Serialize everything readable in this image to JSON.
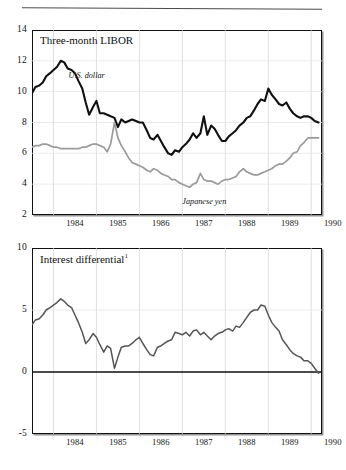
{
  "figure": {
    "has_top_rule": true
  },
  "chart_data": [
    {
      "type": "line",
      "title": "Three-month LIBOR",
      "xlabel": "",
      "ylabel": "",
      "grid": true,
      "legend_position": "inline-annotation",
      "xlim": [
        1983.5,
        1990.25
      ],
      "ylim": [
        2,
        14
      ],
      "yticks": [
        2,
        4,
        6,
        8,
        10,
        12,
        14
      ],
      "xticks": [
        1984,
        1985,
        1986,
        1987,
        1988,
        1989,
        1990
      ],
      "xtick_labels": [
        "1984",
        "1985",
        "1986",
        "1987",
        "1988",
        "1989",
        "1990"
      ],
      "ytick_labels": [
        "2",
        "4",
        "6",
        "8",
        "10",
        "12",
        "14"
      ],
      "annotations": [
        {
          "text": "U.S. dollar",
          "x": 1984.35,
          "y": 11.0,
          "style": "italic"
        },
        {
          "text": "Japanese yen",
          "x": 1987.0,
          "y": 2.85,
          "style": "italic"
        }
      ],
      "x": [
        1983.5,
        1983.58,
        1983.67,
        1983.75,
        1983.83,
        1983.92,
        1984.0,
        1984.08,
        1984.17,
        1984.25,
        1984.33,
        1984.42,
        1984.5,
        1984.58,
        1984.67,
        1984.75,
        1984.83,
        1984.92,
        1985.0,
        1985.08,
        1985.17,
        1985.25,
        1985.33,
        1985.42,
        1985.5,
        1985.58,
        1985.67,
        1985.75,
        1985.83,
        1985.92,
        1986.0,
        1986.08,
        1986.17,
        1986.25,
        1986.33,
        1986.42,
        1986.5,
        1986.58,
        1986.67,
        1986.75,
        1986.83,
        1986.92,
        1987.0,
        1987.08,
        1987.17,
        1987.25,
        1987.33,
        1987.42,
        1987.5,
        1987.58,
        1987.67,
        1987.75,
        1987.83,
        1987.92,
        1988.0,
        1988.08,
        1988.17,
        1988.25,
        1988.33,
        1988.42,
        1988.5,
        1988.58,
        1988.67,
        1988.75,
        1988.83,
        1988.92,
        1989.0,
        1989.08,
        1989.17,
        1989.25,
        1989.33,
        1989.42,
        1989.5,
        1989.58,
        1989.67,
        1989.75,
        1989.83,
        1989.92,
        1990.0,
        1990.08,
        1990.17
      ],
      "series": [
        {
          "name": "U.S. dollar",
          "color": "#111111",
          "width": 2.1,
          "values": [
            9.9,
            10.3,
            10.4,
            10.6,
            11.0,
            11.2,
            11.4,
            11.6,
            12.0,
            11.9,
            11.5,
            11.4,
            11.2,
            10.7,
            10.2,
            9.3,
            8.5,
            9.0,
            9.4,
            8.6,
            8.6,
            8.5,
            8.4,
            8.3,
            7.7,
            8.2,
            8.0,
            8.1,
            8.2,
            8.1,
            8.0,
            8.0,
            7.5,
            7.0,
            6.9,
            7.2,
            6.8,
            6.4,
            6.0,
            5.9,
            6.2,
            6.1,
            6.4,
            6.6,
            6.9,
            7.3,
            7.0,
            7.3,
            8.4,
            7.2,
            7.8,
            7.6,
            7.2,
            6.8,
            6.8,
            7.1,
            7.3,
            7.5,
            7.8,
            8.0,
            8.3,
            8.4,
            8.8,
            9.2,
            9.5,
            9.4,
            10.2,
            9.8,
            9.5,
            9.2,
            9.1,
            9.3,
            8.9,
            8.6,
            8.4,
            8.3,
            8.4,
            8.4,
            8.3,
            8.1,
            8.0
          ]
        },
        {
          "name": "Japanese yen",
          "color": "#9b9b9b",
          "width": 1.7,
          "values": [
            6.4,
            6.5,
            6.5,
            6.6,
            6.6,
            6.5,
            6.4,
            6.4,
            6.3,
            6.3,
            6.3,
            6.3,
            6.3,
            6.3,
            6.4,
            6.4,
            6.5,
            6.6,
            6.6,
            6.5,
            6.4,
            6.1,
            6.6,
            8.0,
            7.0,
            6.5,
            6.1,
            5.7,
            5.4,
            5.3,
            5.2,
            5.1,
            4.9,
            4.8,
            5.0,
            4.9,
            4.7,
            4.6,
            4.5,
            4.3,
            4.3,
            4.1,
            4.0,
            3.9,
            3.8,
            4.0,
            4.1,
            4.7,
            4.3,
            4.2,
            4.2,
            4.1,
            4.0,
            4.2,
            4.3,
            4.3,
            4.4,
            4.5,
            4.8,
            5.0,
            4.8,
            4.7,
            4.6,
            4.6,
            4.7,
            4.8,
            4.9,
            5.0,
            5.2,
            5.3,
            5.3,
            5.5,
            5.7,
            6.0,
            6.1,
            6.5,
            6.7,
            7.0,
            7.0,
            7.0,
            7.0
          ]
        }
      ]
    },
    {
      "type": "line",
      "title": "Interest differential",
      "title_superscript": "1",
      "xlabel": "",
      "ylabel": "",
      "grid": true,
      "zero_line": 0,
      "xlim": [
        1983.5,
        1990.25
      ],
      "ylim": [
        -5,
        10
      ],
      "yticks": [
        -5,
        0,
        5,
        10
      ],
      "xticks": [
        1984,
        1985,
        1986,
        1987,
        1988,
        1989,
        1990
      ],
      "xtick_labels": [
        "1984",
        "1985",
        "1986",
        "1987",
        "1988",
        "1989",
        "1990"
      ],
      "ytick_labels": [
        "-5",
        "0",
        "5",
        "10"
      ],
      "x": [
        1983.5,
        1983.58,
        1983.67,
        1983.75,
        1983.83,
        1983.92,
        1984.0,
        1984.08,
        1984.17,
        1984.25,
        1984.33,
        1984.42,
        1984.5,
        1984.58,
        1984.67,
        1984.75,
        1984.83,
        1984.92,
        1985.0,
        1985.08,
        1985.17,
        1985.25,
        1985.33,
        1985.42,
        1985.5,
        1985.58,
        1985.67,
        1985.75,
        1985.83,
        1985.92,
        1986.0,
        1986.08,
        1986.17,
        1986.25,
        1986.33,
        1986.42,
        1986.5,
        1986.58,
        1986.67,
        1986.75,
        1986.83,
        1986.92,
        1987.0,
        1987.08,
        1987.17,
        1987.25,
        1987.33,
        1987.42,
        1987.5,
        1987.58,
        1987.67,
        1987.75,
        1987.83,
        1987.92,
        1988.0,
        1988.08,
        1988.17,
        1988.25,
        1988.33,
        1988.42,
        1988.5,
        1988.58,
        1988.67,
        1988.75,
        1988.83,
        1988.92,
        1989.0,
        1989.08,
        1989.17,
        1989.25,
        1989.33,
        1989.42,
        1989.5,
        1989.58,
        1989.67,
        1989.75,
        1989.83,
        1989.92,
        1990.0,
        1990.08,
        1990.17
      ],
      "series": [
        {
          "name": "Interest differential",
          "color": "#555555",
          "width": 1.5,
          "values": [
            3.8,
            4.2,
            4.3,
            4.6,
            5.0,
            5.2,
            5.4,
            5.6,
            5.9,
            5.7,
            5.4,
            5.2,
            4.6,
            4.0,
            3.2,
            2.3,
            2.6,
            3.1,
            2.8,
            2.2,
            1.6,
            2.1,
            1.9,
            0.3,
            1.2,
            2.0,
            2.1,
            2.1,
            2.3,
            2.6,
            2.8,
            2.3,
            1.8,
            1.4,
            1.3,
            2.0,
            2.1,
            2.3,
            2.5,
            2.6,
            3.2,
            3.1,
            3.0,
            3.2,
            2.9,
            3.3,
            3.4,
            3.0,
            3.2,
            2.9,
            2.6,
            2.9,
            3.1,
            3.2,
            3.4,
            3.5,
            3.3,
            3.7,
            3.6,
            4.0,
            4.4,
            4.8,
            5.0,
            5.0,
            5.4,
            5.3,
            4.6,
            4.0,
            3.6,
            3.3,
            2.6,
            2.2,
            1.8,
            1.5,
            1.3,
            1.2,
            0.9,
            0.9,
            0.7,
            0.3,
            -0.1
          ]
        }
      ]
    }
  ]
}
